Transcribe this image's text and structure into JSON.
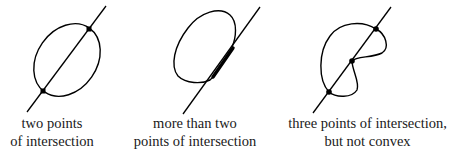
{
  "figure": {
    "panels": [
      {
        "id": "convex",
        "caption_lines": [
          "two points",
          "of intersection"
        ],
        "intersection_points": 2,
        "shape": "ellipse"
      },
      {
        "id": "overlap",
        "caption_lines": [
          "more than two",
          "points of intersection"
        ],
        "intersection_points": "segment",
        "shape": "loop with straight side"
      },
      {
        "id": "nonconvex",
        "caption_lines": [
          "three points of intersection,",
          "but not convex"
        ],
        "intersection_points": 3,
        "shape": "kidney"
      }
    ],
    "colors": {
      "stroke": "#000000",
      "background": "#ffffff"
    }
  }
}
